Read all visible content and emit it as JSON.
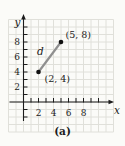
{
  "figure": {
    "x_axis_label": "x",
    "y_axis_label": "y",
    "caption": "(a)"
  },
  "chart_data": {
    "type": "scatter",
    "title": "",
    "points": [
      {
        "x": 2,
        "y": 4,
        "label": "(2, 4)"
      },
      {
        "x": 5,
        "y": 8,
        "label": "(5, 8)"
      }
    ],
    "segment": {
      "from": [
        2,
        4
      ],
      "to": [
        5,
        8
      ],
      "label": "d"
    },
    "x_ticks": [
      2,
      4,
      6,
      8
    ],
    "y_ticks": [
      2,
      4,
      6,
      8
    ],
    "minor_tick_every": 1,
    "xlim": [
      -2,
      12
    ],
    "ylim": [
      -4,
      11
    ],
    "grid": true,
    "legend": false,
    "colors": {
      "background": "#fbfbf8",
      "grid": "#e0e0da",
      "axis": "#1c1c1c",
      "segment": "#8f8f8f",
      "point": "#111111",
      "text": "#1c1c1c"
    }
  }
}
